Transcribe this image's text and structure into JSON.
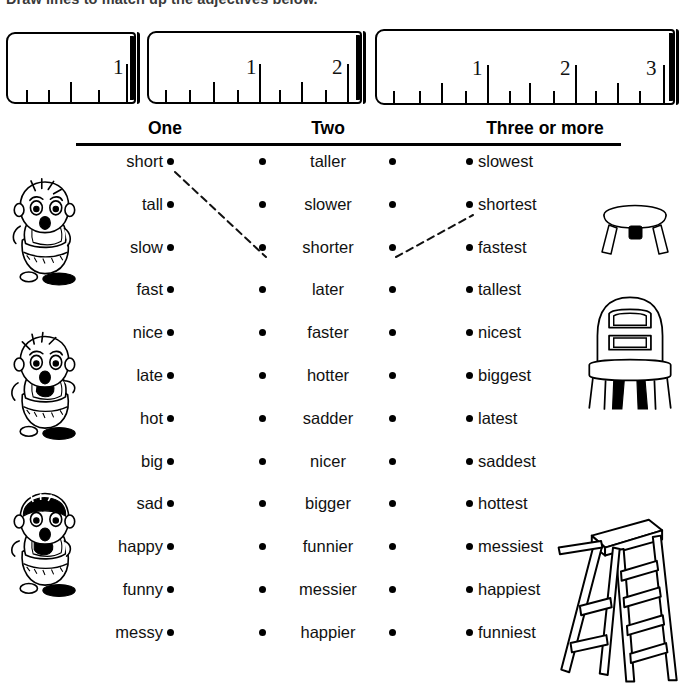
{
  "instruction": "Draw lines to match up the adjectives below.",
  "rulers": [
    {
      "name": "ruler-one",
      "x": 6,
      "y": 32,
      "w": 130,
      "h": 72,
      "labels": [
        "1"
      ],
      "label_positions": [
        118
      ],
      "major_ticks": [
        118
      ],
      "half_ticks": [
        62
      ],
      "minor_ticks": [
        18,
        40,
        90
      ]
    },
    {
      "name": "ruler-two",
      "x": 147,
      "y": 31,
      "w": 215,
      "h": 73,
      "labels": [
        "1",
        "2"
      ],
      "label_positions": [
        110,
        196
      ],
      "major_ticks": [
        110,
        198
      ],
      "half_ticks": [
        64,
        152
      ],
      "minor_ticks": [
        16,
        40,
        88,
        130,
        176
      ]
    },
    {
      "name": "ruler-three",
      "x": 375,
      "y": 29,
      "w": 300,
      "h": 76,
      "labels": [
        "1",
        "2",
        "3"
      ],
      "label_positions": [
        108,
        196,
        282
      ],
      "major_ticks": [
        110,
        198,
        286
      ],
      "half_ticks": [
        64,
        152,
        240
      ],
      "minor_ticks": [
        16,
        42,
        88,
        132,
        176,
        218,
        262
      ]
    }
  ],
  "headers": [
    {
      "label": "One",
      "left": 90,
      "width": 150
    },
    {
      "label": "Two",
      "left": 258,
      "width": 140
    },
    {
      "label": "Three or more",
      "left": 440,
      "width": 210
    }
  ],
  "columns": {
    "one": [
      "short",
      "tall",
      "slow",
      "fast",
      "nice",
      "late",
      "hot",
      "big",
      "sad",
      "happy",
      "funny",
      "messy"
    ],
    "two": [
      "taller",
      "slower",
      "shorter",
      "later",
      "faster",
      "hotter",
      "sadder",
      "nicer",
      "bigger",
      "funnier",
      "messier",
      "happier"
    ],
    "three": [
      "slowest",
      "shortest",
      "fastest",
      "tallest",
      "nicest",
      "biggest",
      "latest",
      "saddest",
      "hottest",
      "messiest",
      "happiest",
      "funniest"
    ]
  },
  "answer_lines": [
    {
      "name": "line-short-to-shorter",
      "from": "one.short",
      "to": "two.shorter",
      "x1": 175,
      "y1": 172,
      "x2": 266,
      "y2": 257
    },
    {
      "name": "line-shorter-to-shortest",
      "from": "two.shorter",
      "to": "three.shortest",
      "x1": 396,
      "y1": 257,
      "x2": 473,
      "y2": 215
    }
  ],
  "illustrations": {
    "left": [
      {
        "name": "baby-standing-illustration",
        "x": 4,
        "y": 168,
        "w": 82,
        "h": 125
      },
      {
        "name": "baby-crawling-illustration",
        "x": 4,
        "y": 320,
        "w": 82,
        "h": 130
      },
      {
        "name": "baby-sitting-illustration",
        "x": 4,
        "y": 477,
        "w": 82,
        "h": 130
      }
    ],
    "right": [
      {
        "name": "stool-illustration",
        "x": 592,
        "y": 193,
        "w": 86,
        "h": 73
      },
      {
        "name": "chair-illustration",
        "x": 580,
        "y": 288,
        "w": 100,
        "h": 128
      },
      {
        "name": "ladder-illustration",
        "x": 552,
        "y": 498,
        "w": 130,
        "h": 196
      }
    ]
  },
  "ruler_tick_numbers": {
    "one": "1",
    "two_1": "1",
    "two_2": "2",
    "three_1": "1",
    "three_2": "2",
    "three_3": "3"
  },
  "colors": {
    "ink": "#000000",
    "paper": "#ffffff",
    "pencil": "#111111"
  }
}
